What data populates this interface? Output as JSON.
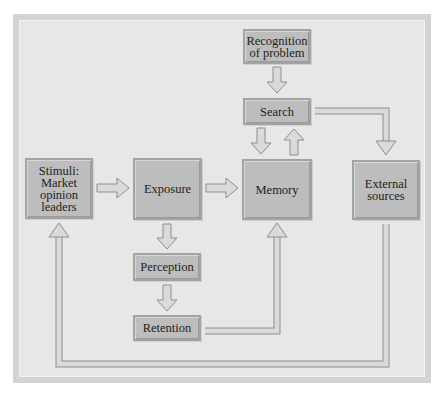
{
  "diagram": {
    "title": "",
    "nodes": {
      "recognition": {
        "label": "Recognition of problem",
        "lines": [
          "Recognition",
          "of problem"
        ]
      },
      "search": {
        "label": "Search"
      },
      "stimuli": {
        "label": "Stimuli: Market opinion leaders",
        "lines": [
          "Stimuli:",
          "Market",
          "opinion",
          "leaders"
        ]
      },
      "exposure": {
        "label": "Exposure"
      },
      "memory": {
        "label": "Memory"
      },
      "external": {
        "label": "External sources",
        "lines": [
          "External",
          "sources"
        ]
      },
      "perception": {
        "label": "Perception"
      },
      "retention": {
        "label": "Retention"
      }
    },
    "edges": [
      {
        "from": "Recognition of problem",
        "to": "Search"
      },
      {
        "from": "Search",
        "to": "Memory"
      },
      {
        "from": "Memory",
        "to": "Search"
      },
      {
        "from": "Search",
        "to": "External sources"
      },
      {
        "from": "Stimuli: Market opinion leaders",
        "to": "Exposure"
      },
      {
        "from": "Exposure",
        "to": "Memory"
      },
      {
        "from": "Exposure",
        "to": "Perception"
      },
      {
        "from": "Perception",
        "to": "Retention"
      },
      {
        "from": "Retention",
        "to": "Memory"
      },
      {
        "from": "External sources",
        "to": "Stimuli: Market opinion leaders"
      }
    ],
    "colors": {
      "background": "#e7e7e7",
      "frame": "#d3d3d3",
      "box_fill": "#bdbdbd",
      "box_border": "#a3a3a3",
      "arrow_fill": "#d9d9d9",
      "arrow_stroke": "#8f8f8f",
      "text": "#222222"
    }
  }
}
